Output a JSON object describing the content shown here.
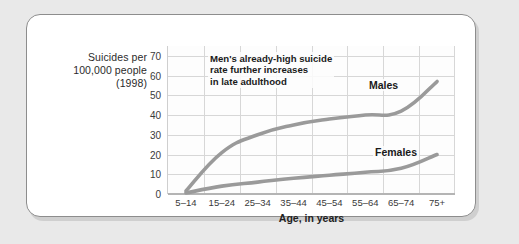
{
  "y_axis": {
    "title_lines": [
      "Suicides per",
      "100,000 people",
      "(1998)"
    ],
    "line1": "Suicides per",
    "line2": "100,000 people",
    "line3": "(1998)"
  },
  "x_axis": {
    "title": "Age, in years"
  },
  "annotation": {
    "text": "Men's already-high suicide\nrate further increases\nin late adulthood"
  },
  "labels": {
    "males": "Males",
    "females": "Females"
  },
  "colors": {
    "line": "#9a9a9a",
    "grid": "#d7d7d7",
    "page_background": "#e9e9e9",
    "card_background": "#ffffff",
    "card_border": "#8d8d8d",
    "text": "#2b2b2b"
  },
  "chart_data": {
    "type": "line",
    "title": "",
    "xlabel": "Age, in years",
    "ylabel": "Suicides per 100,000 people (1998)",
    "categories": [
      "5–14",
      "15–24",
      "25–34",
      "35–44",
      "45–54",
      "55–64",
      "65–74",
      "75+"
    ],
    "ylim": [
      0,
      75
    ],
    "yticks": [
      0,
      10,
      20,
      30,
      40,
      50,
      60,
      70
    ],
    "grid": true,
    "legend": "inline-labels",
    "series": [
      {
        "name": "Males",
        "values": [
          1.5,
          21,
          30,
          35,
          38,
          40,
          42,
          57
        ]
      },
      {
        "name": "Females",
        "values": [
          0.5,
          4,
          6,
          8,
          9.5,
          11,
          13,
          20
        ]
      }
    ],
    "annotations": [
      {
        "text": "Men's already-high suicide rate further increases in late adulthood",
        "target": "Males"
      }
    ]
  }
}
